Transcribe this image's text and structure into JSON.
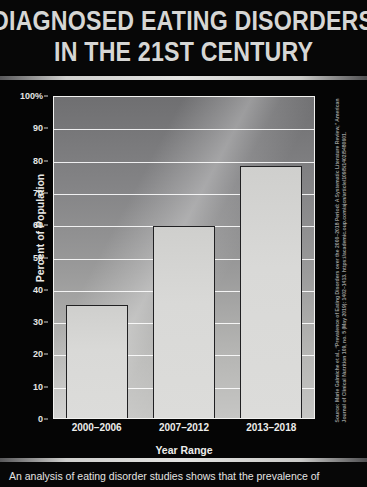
{
  "title": {
    "line1": "Diagnosed Eating Disorders",
    "line2": "In the 21st Century"
  },
  "chart_data": {
    "type": "bar",
    "title": "Diagnosed Eating Disorders In the 21st Century",
    "categories": [
      "2000–2006",
      "2007–2012",
      "2013–2018"
    ],
    "values": [
      35,
      59.5,
      78
    ],
    "xlabel": "Year Range",
    "ylabel": "Percent of Population",
    "ylim": [
      0,
      100
    ],
    "ytick_values": [
      0,
      10,
      20,
      30,
      40,
      50,
      60,
      70,
      80,
      90,
      100
    ],
    "ytick_labels": [
      "0",
      "10",
      "20",
      "30",
      "40",
      "50",
      "60",
      "70",
      "80",
      "90",
      "100%"
    ],
    "grid": true,
    "legend": "none",
    "bar_fill_color": "#d9d9d7",
    "bar_edge_color": "#202022",
    "plot_background": "#9b9b9b"
  },
  "source": {
    "citation": "Source: Marie Galmiche et al., “Prevalence of Eating Disorders over the 2000–2018 Period: A Systematic Literature Review,” American Journal of Clinical Nutrition 109, no. 5 (May 2019): 1402–1413. https://academic.oup.com/ajcn/article/109/5/1402/5480601."
  },
  "caption": {
    "text": "An analysis of eating disorder studies shows that the prevalence of"
  },
  "colors": {
    "background": "#050505",
    "title_text": "#d6d6d4",
    "divider": "#d8d8d6",
    "axis_text": "#ededeb"
  }
}
